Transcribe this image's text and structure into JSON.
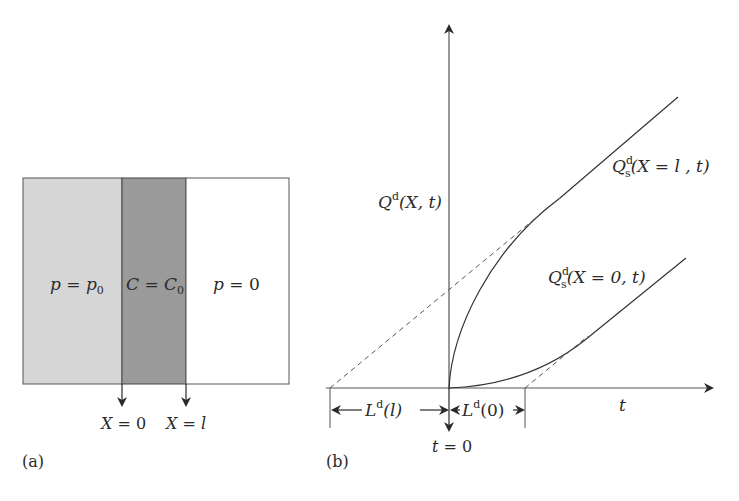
{
  "panel_a": {
    "label": "(a)",
    "regions": [
      {
        "name": "left-region",
        "label_var": "p",
        "label_eq": " = ",
        "label_rhs": "p",
        "label_rhs_sub": "0",
        "fill": "#d6d6d6"
      },
      {
        "name": "middle-region",
        "label_var": "C",
        "label_eq": " = ",
        "label_rhs": "C",
        "label_rhs_sub": "0",
        "fill": "#9a9a9a"
      },
      {
        "name": "right-region",
        "label_var": "p",
        "label_eq": " = ",
        "label_rhs": "0",
        "fill": "#ffffff"
      }
    ],
    "markers": [
      {
        "label_var": "X",
        "label_eq": " = ",
        "label_val": "0"
      },
      {
        "label_var": "X",
        "label_eq": " = ",
        "label_val": "l"
      }
    ]
  },
  "panel_b": {
    "label": "(b)",
    "y_axis_label": {
      "main": "Q",
      "sup": "d",
      "args": "(X, t)"
    },
    "x_axis_label": "t",
    "origin_label": {
      "var": "t",
      "eq": " = ",
      "val": "0"
    },
    "curve_upper_label": {
      "main": "Q",
      "sup": "d",
      "sub": "s",
      "args": "(X = l , t)"
    },
    "curve_lower_label": {
      "main": "Q",
      "sup": "d",
      "sub": "s",
      "args": "(X = 0, t)"
    },
    "lag_left": {
      "main": "L",
      "sup": "d",
      "args": "(l)"
    },
    "lag_right": {
      "main": "L",
      "sup": "d",
      "args": "(0)"
    }
  }
}
